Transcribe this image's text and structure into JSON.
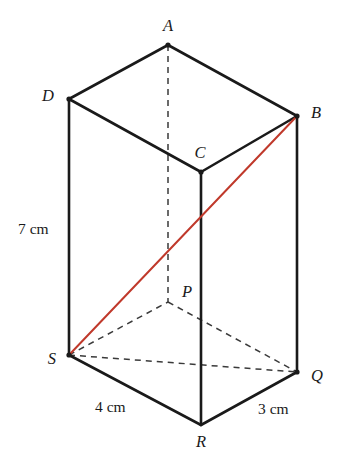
{
  "figure": {
    "background_color": "#ffffff",
    "solid_edge_color": "#1a1a1a",
    "hidden_edge_color": "#3a3a3a",
    "diagonal_color": "#c0392b",
    "vertices": [
      {
        "id": "A",
        "label": "A",
        "x": 168,
        "y": 45,
        "label_x": 168,
        "label_y": 31,
        "label_anchor": "middle",
        "visible_dot": true
      },
      {
        "id": "D",
        "label": "D",
        "x": 69,
        "y": 99,
        "label_x": 54,
        "label_y": 101,
        "label_anchor": "end",
        "visible_dot": true
      },
      {
        "id": "B",
        "label": "B",
        "x": 297,
        "y": 116,
        "label_x": 311,
        "label_y": 118,
        "label_anchor": "start",
        "visible_dot": true
      },
      {
        "id": "C",
        "label": "C",
        "x": 201,
        "y": 172,
        "label_x": 200,
        "label_y": 158,
        "label_anchor": "middle",
        "visible_dot": true
      },
      {
        "id": "P",
        "label": "P",
        "x": 168,
        "y": 302,
        "label_x": 182,
        "label_y": 297,
        "label_anchor": "start",
        "visible_dot": false
      },
      {
        "id": "S",
        "label": "S",
        "x": 69,
        "y": 355,
        "label_x": 56,
        "label_y": 364,
        "label_anchor": "end",
        "visible_dot": true
      },
      {
        "id": "Q",
        "label": "Q",
        "x": 297,
        "y": 372,
        "label_x": 311,
        "label_y": 381,
        "label_anchor": "start",
        "visible_dot": true
      },
      {
        "id": "R",
        "label": "R",
        "x": 201,
        "y": 425,
        "label_x": 201,
        "label_y": 447,
        "label_anchor": "middle",
        "visible_dot": false
      }
    ],
    "solid_edges": [
      {
        "name": "edge-D-A",
        "from": "D",
        "to": "A",
        "x1": 69,
        "y1": 99,
        "x2": 168,
        "y2": 45
      },
      {
        "name": "edge-A-B",
        "from": "A",
        "to": "B",
        "x1": 168,
        "y1": 45,
        "x2": 297,
        "y2": 116
      },
      {
        "name": "edge-B-C",
        "from": "B",
        "to": "C",
        "x1": 297,
        "y1": 116,
        "x2": 201,
        "y2": 172
      },
      {
        "name": "edge-C-D",
        "from": "C",
        "to": "D",
        "x1": 201,
        "y1": 172,
        "x2": 69,
        "y2": 99
      },
      {
        "name": "edge-D-S",
        "from": "D",
        "to": "S",
        "x1": 69,
        "y1": 99,
        "x2": 69,
        "y2": 355
      },
      {
        "name": "edge-B-Q",
        "from": "B",
        "to": "Q",
        "x1": 297,
        "y1": 116,
        "x2": 297,
        "y2": 372
      },
      {
        "name": "edge-C-R",
        "from": "C",
        "to": "R",
        "x1": 201,
        "y1": 172,
        "x2": 201,
        "y2": 425
      },
      {
        "name": "edge-S-R",
        "from": "S",
        "to": "R",
        "x1": 69,
        "y1": 355,
        "x2": 201,
        "y2": 425
      },
      {
        "name": "edge-R-Q",
        "from": "R",
        "to": "Q",
        "x1": 201,
        "y1": 425,
        "x2": 297,
        "y2": 372
      }
    ],
    "hidden_edges": [
      {
        "name": "edge-A-P",
        "from": "A",
        "to": "P",
        "x1": 168,
        "y1": 45,
        "x2": 168,
        "y2": 302
      },
      {
        "name": "edge-S-P",
        "from": "S",
        "to": "P",
        "x1": 69,
        "y1": 355,
        "x2": 168,
        "y2": 302
      },
      {
        "name": "edge-P-Q",
        "from": "P",
        "to": "Q",
        "x1": 168,
        "y1": 302,
        "x2": 297,
        "y2": 372
      },
      {
        "name": "edge-S-Q",
        "from": "S",
        "to": "Q",
        "x1": 69,
        "y1": 355,
        "x2": 297,
        "y2": 372
      }
    ],
    "diagonals": [
      {
        "name": "diagonal-S-B",
        "from": "S",
        "to": "B",
        "x1": 69,
        "y1": 355,
        "x2": 297,
        "y2": 116,
        "color": "#c0392b"
      }
    ],
    "dimensions": [
      {
        "id": "height",
        "text": "7 cm",
        "x": 18,
        "y": 234,
        "anchor": "start",
        "measures": "D-S"
      },
      {
        "id": "length",
        "text": "4 cm",
        "x": 95,
        "y": 412,
        "anchor": "start",
        "measures": "S-R"
      },
      {
        "id": "width",
        "text": "3 cm",
        "x": 258,
        "y": 414,
        "anchor": "start",
        "measures": "R-Q"
      }
    ]
  }
}
